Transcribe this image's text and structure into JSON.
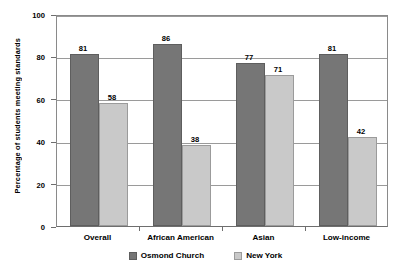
{
  "chart_data": {
    "type": "bar",
    "title": "",
    "xlabel": "",
    "ylabel": "Percentage of students meeting standards",
    "categories": [
      "Overall",
      "African American",
      "Asian",
      "Low-income"
    ],
    "series": [
      {
        "name": "Osmond Church",
        "color": "#767676",
        "values": [
          81,
          86,
          77,
          81
        ]
      },
      {
        "name": "New York",
        "color": "#c9c9c9",
        "values": [
          58,
          38,
          71,
          42
        ]
      }
    ],
    "ylim": [
      0,
      100
    ],
    "yticks": [
      0,
      20,
      40,
      60,
      80,
      100
    ],
    "ytick_labels": [
      "0",
      "20",
      "40",
      "60",
      "80",
      "100"
    ],
    "grid": true,
    "grid_axis": "y",
    "legend_position": "bottom",
    "data_labels": true
  }
}
